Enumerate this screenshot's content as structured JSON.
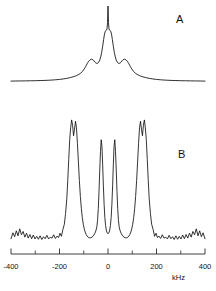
{
  "figure": {
    "panels": [
      {
        "id": "A",
        "label": "A",
        "description": "smooth simulated lineshape"
      },
      {
        "id": "B",
        "label": "B",
        "description": "experimental noisy spectrum"
      }
    ]
  },
  "axis": {
    "unit": "kHz",
    "min": -400,
    "max": 400,
    "tick_labels": [
      "-400",
      "-200",
      "0",
      "200",
      "400"
    ],
    "tick_values": [
      -400,
      -200,
      0,
      200,
      400
    ],
    "minor_tick_values": [
      -300,
      -100,
      100,
      300
    ],
    "line_color": "#2a2a2a"
  },
  "chart_data": [
    {
      "type": "line",
      "id": "A",
      "title": "",
      "xlabel": "kHz",
      "ylabel": "",
      "xlim": [
        -400,
        400
      ],
      "ylim": [
        0,
        1
      ],
      "grid": false,
      "legend": "none",
      "annotations": [
        "A"
      ],
      "x": [
        -400,
        -380,
        -360,
        -340,
        -320,
        -300,
        -280,
        -260,
        -240,
        -220,
        -200,
        -185,
        -170,
        -155,
        -140,
        -130,
        -120,
        -112,
        -105,
        -98,
        -92,
        -86,
        -80,
        -74,
        -68,
        -62,
        -58,
        -54,
        -50,
        -46,
        -42,
        -38,
        -34,
        -30,
        -26,
        -22,
        -18,
        -15,
        -12,
        -9,
        -6,
        -4,
        -2,
        0,
        2,
        4,
        6,
        9,
        12,
        15,
        18,
        22,
        26,
        30,
        34,
        38,
        42,
        46,
        50,
        54,
        58,
        62,
        68,
        74,
        80,
        86,
        92,
        98,
        105,
        112,
        120,
        130,
        140,
        155,
        170,
        185,
        200,
        220,
        240,
        260,
        280,
        300,
        320,
        340,
        360,
        380,
        400
      ],
      "y": [
        0.012,
        0.013,
        0.014,
        0.015,
        0.016,
        0.017,
        0.019,
        0.021,
        0.024,
        0.028,
        0.034,
        0.04,
        0.048,
        0.058,
        0.072,
        0.084,
        0.1,
        0.118,
        0.14,
        0.172,
        0.205,
        0.24,
        0.272,
        0.292,
        0.3,
        0.292,
        0.278,
        0.262,
        0.25,
        0.244,
        0.248,
        0.262,
        0.288,
        0.33,
        0.392,
        0.47,
        0.56,
        0.62,
        0.66,
        0.678,
        0.684,
        0.7,
        0.78,
        1.0,
        0.78,
        0.7,
        0.684,
        0.678,
        0.66,
        0.62,
        0.56,
        0.47,
        0.392,
        0.33,
        0.288,
        0.262,
        0.248,
        0.244,
        0.25,
        0.262,
        0.278,
        0.292,
        0.3,
        0.292,
        0.272,
        0.24,
        0.205,
        0.172,
        0.14,
        0.118,
        0.1,
        0.084,
        0.072,
        0.058,
        0.048,
        0.04,
        0.034,
        0.028,
        0.024,
        0.021,
        0.019,
        0.017,
        0.016,
        0.015,
        0.014,
        0.013,
        0.012
      ]
    },
    {
      "type": "line",
      "id": "B",
      "title": "",
      "xlabel": "kHz",
      "ylabel": "",
      "xlim": [
        -400,
        400
      ],
      "ylim": [
        0,
        1
      ],
      "grid": false,
      "legend": "none",
      "annotations": [
        "B"
      ],
      "peaks_kHz": [
        -165,
        -140,
        -32,
        32,
        140,
        165
      ],
      "x": [
        -400,
        -392,
        -385,
        -378,
        -371,
        -364,
        -357,
        -350,
        -343,
        -336,
        -329,
        -322,
        -315,
        -308,
        -301,
        -294,
        -287,
        -280,
        -273,
        -266,
        -259,
        -252,
        -245,
        -238,
        -231,
        -224,
        -217,
        -210,
        -204,
        -198,
        -192,
        -186,
        -180,
        -175,
        -170,
        -166,
        -162,
        -158,
        -154,
        -150,
        -146,
        -142,
        -138,
        -134,
        -130,
        -126,
        -122,
        -118,
        -114,
        -110,
        -106,
        -102,
        -98,
        -94,
        -90,
        -86,
        -82,
        -78,
        -74,
        -70,
        -66,
        -62,
        -58,
        -54,
        -50,
        -46,
        -43,
        -40,
        -37,
        -34,
        -31,
        -28,
        -25,
        -22,
        -19,
        -16,
        -13,
        -10,
        -7,
        -4,
        0,
        4,
        7,
        10,
        13,
        16,
        19,
        22,
        25,
        28,
        31,
        34,
        37,
        40,
        43,
        46,
        50,
        54,
        58,
        62,
        66,
        70,
        74,
        78,
        82,
        86,
        90,
        94,
        98,
        102,
        106,
        110,
        114,
        118,
        122,
        126,
        130,
        134,
        138,
        142,
        146,
        150,
        154,
        158,
        162,
        166,
        170,
        175,
        180,
        186,
        192,
        198,
        204,
        210,
        217,
        224,
        231,
        238,
        245,
        252,
        259,
        266,
        273,
        280,
        287,
        294,
        301,
        308,
        315,
        322,
        329,
        336,
        343,
        350,
        357,
        364,
        371,
        378,
        385,
        392,
        400
      ],
      "y": [
        0.04,
        0.085,
        0.055,
        0.1,
        0.062,
        0.115,
        0.07,
        0.095,
        0.052,
        0.082,
        0.045,
        0.072,
        0.04,
        0.068,
        0.038,
        0.058,
        0.036,
        0.062,
        0.034,
        0.055,
        0.04,
        0.066,
        0.038,
        0.052,
        0.044,
        0.07,
        0.042,
        0.06,
        0.048,
        0.082,
        0.058,
        0.11,
        0.15,
        0.23,
        0.34,
        0.48,
        0.64,
        0.79,
        0.88,
        0.94,
        0.9,
        0.82,
        0.87,
        0.93,
        0.88,
        0.76,
        0.62,
        0.48,
        0.36,
        0.27,
        0.2,
        0.15,
        0.115,
        0.09,
        0.072,
        0.06,
        0.052,
        0.048,
        0.046,
        0.048,
        0.052,
        0.058,
        0.068,
        0.082,
        0.1,
        0.13,
        0.18,
        0.27,
        0.4,
        0.56,
        0.7,
        0.79,
        0.74,
        0.6,
        0.44,
        0.3,
        0.2,
        0.14,
        0.105,
        0.085,
        0.078,
        0.085,
        0.105,
        0.14,
        0.2,
        0.3,
        0.44,
        0.6,
        0.74,
        0.79,
        0.7,
        0.56,
        0.4,
        0.27,
        0.18,
        0.13,
        0.1,
        0.082,
        0.068,
        0.058,
        0.052,
        0.048,
        0.046,
        0.048,
        0.052,
        0.06,
        0.072,
        0.09,
        0.115,
        0.15,
        0.2,
        0.27,
        0.36,
        0.48,
        0.62,
        0.76,
        0.88,
        0.93,
        0.87,
        0.82,
        0.9,
        0.94,
        0.88,
        0.79,
        0.64,
        0.48,
        0.34,
        0.23,
        0.15,
        0.11,
        0.058,
        0.082,
        0.048,
        0.06,
        0.042,
        0.07,
        0.044,
        0.052,
        0.038,
        0.066,
        0.04,
        0.055,
        0.034,
        0.062,
        0.036,
        0.058,
        0.038,
        0.068,
        0.04,
        0.072,
        0.045,
        0.082,
        0.052,
        0.095,
        0.07,
        0.115,
        0.062,
        0.1,
        0.055,
        0.085,
        0.04
      ]
    }
  ]
}
